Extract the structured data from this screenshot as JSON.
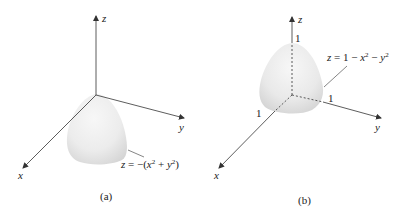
{
  "figure": {
    "panels": [
      {
        "id": "a",
        "caption": "(a)",
        "axis_labels": {
          "z": "z",
          "y": "y",
          "x": "x"
        },
        "surface_label": "z = −(x² + y²)",
        "surface_label_parts": {
          "lhs": "z",
          "eq": " = −(",
          "x": "x",
          "x_sup": "2",
          "plus": " + ",
          "y": "y",
          "y_sup": "2",
          "close": ")"
        }
      },
      {
        "id": "b",
        "caption": "(b)",
        "axis_labels": {
          "z": "z",
          "y": "y",
          "x": "x"
        },
        "tick_labels": {
          "z": "1",
          "x": "1",
          "y": "1"
        },
        "surface_label": "z = 1 − x² − y²",
        "surface_label_parts": {
          "lhs": "z",
          "eq": " = 1 − ",
          "x": "x",
          "x_sup": "2",
          "minus": " − ",
          "y": "y",
          "y_sup": "2"
        }
      }
    ],
    "colors": {
      "axis": "#333333",
      "surface_light": "#f2f2f2",
      "surface_dark": "#d6d6d6",
      "text": "#222222"
    }
  }
}
